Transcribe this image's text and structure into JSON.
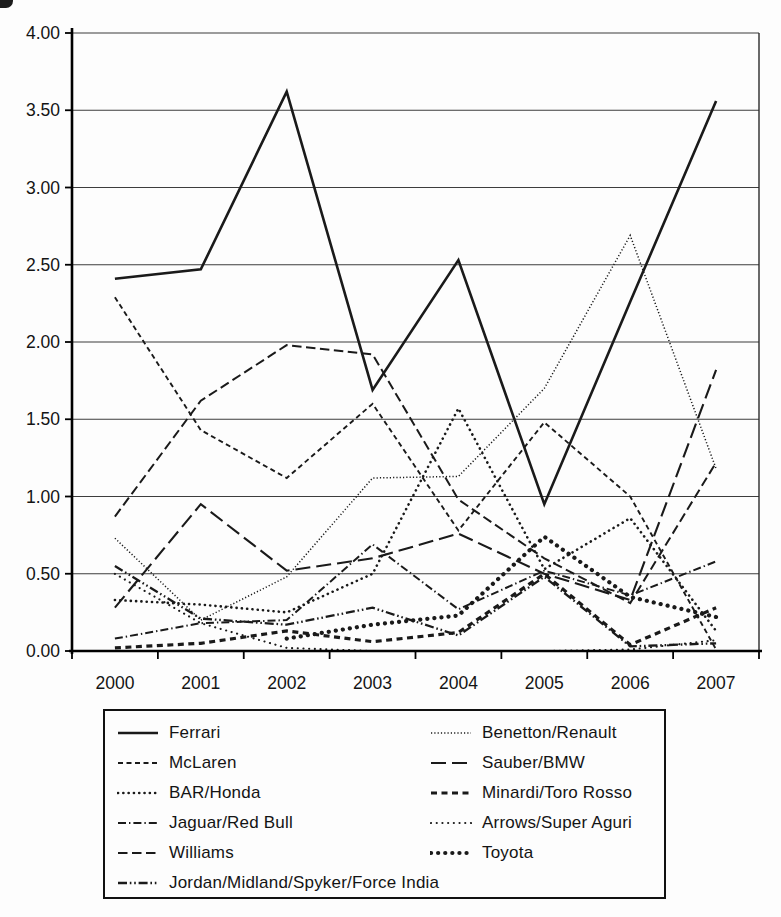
{
  "chart_data": {
    "type": "line",
    "title": "",
    "xlabel": "",
    "ylabel": "",
    "x": [
      "2000",
      "2001",
      "2002",
      "2003",
      "2004",
      "2005",
      "2006",
      "2007"
    ],
    "ylim": [
      0,
      4
    ],
    "ytick_step": 0.5,
    "ytick_labels": [
      "0.00",
      "0.50",
      "1.00",
      "1.50",
      "2.00",
      "2.50",
      "3.00",
      "3.50",
      "4.00"
    ],
    "grid": "horizontal",
    "line_color": "#1a1a1a",
    "legend_position": "bottom-box-two-columns",
    "series": [
      {
        "name": "Ferrari",
        "line_style": "solid",
        "values": [
          2.41,
          2.47,
          3.62,
          1.69,
          2.53,
          0.95,
          2.26,
          3.56
        ]
      },
      {
        "name": "McLaren",
        "line_style": "short-dash",
        "values": [
          2.29,
          1.43,
          1.12,
          1.6,
          0.78,
          1.48,
          1.0,
          0.01
        ]
      },
      {
        "name": "BAR/Honda",
        "line_style": "spaced-dot",
        "values": [
          0.33,
          0.3,
          0.25,
          0.5,
          1.57,
          0.53,
          0.86,
          0.13
        ]
      },
      {
        "name": "Jaguar/Red Bull",
        "line_style": "dash-dot",
        "values": [
          0.08,
          0.18,
          0.2,
          0.69,
          0.27,
          0.52,
          0.36,
          0.58
        ]
      },
      {
        "name": "Williams",
        "line_style": "medium-dash",
        "values": [
          0.87,
          1.62,
          1.98,
          1.92,
          0.98,
          0.6,
          0.31,
          1.22
        ]
      },
      {
        "name": "Jordan/Midland/Spyker/Force India",
        "line_style": "dash-dot-dot",
        "values": [
          0.55,
          0.21,
          0.17,
          0.28,
          0.1,
          0.48,
          0.03,
          0.05
        ]
      },
      {
        "name": "Benetton/Renault",
        "line_style": "fine-dot",
        "values": [
          0.73,
          0.2,
          0.48,
          1.12,
          1.13,
          1.7,
          2.69,
          1.18
        ]
      },
      {
        "name": "Sauber/BMW",
        "line_style": "long-dash",
        "values": [
          0.28,
          0.95,
          0.52,
          0.6,
          0.76,
          0.5,
          0.33,
          1.82
        ]
      },
      {
        "name": "Minardi/Toro Rosso",
        "line_style": "bold-dash",
        "values": [
          0.02,
          0.05,
          0.13,
          0.06,
          0.12,
          0.5,
          0.04,
          0.28
        ]
      },
      {
        "name": "Arrows/Super Aguri",
        "line_style": "sparse-dot",
        "values": [
          0.5,
          0.18,
          0.02,
          0.0,
          0.0,
          0.0,
          0.01,
          0.07
        ]
      },
      {
        "name": "Toyota",
        "line_style": "bold-dot",
        "values": [
          null,
          null,
          0.08,
          0.17,
          0.23,
          0.74,
          0.35,
          0.22
        ]
      }
    ],
    "legend_columns": [
      [
        0,
        1,
        2,
        3,
        4,
        5
      ],
      [
        6,
        7,
        8,
        9,
        10
      ]
    ]
  }
}
